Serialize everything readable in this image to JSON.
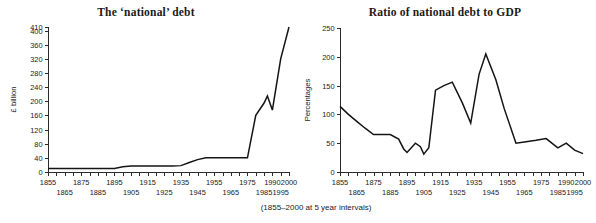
{
  "caption": "(1855–2000 at 5 year intervals)",
  "chart_data": [
    {
      "type": "line",
      "id": "national-debt",
      "title": "The ‘national’ debt",
      "xlabel": "",
      "ylabel": "£ billion",
      "ylim": [
        0,
        410
      ],
      "xlim": [
        1855,
        2000
      ],
      "grid": false,
      "legend": "none",
      "ytick_labels": [
        "0",
        "40",
        "80",
        "120",
        "160",
        "200",
        "240",
        "280",
        "320",
        "360",
        "400",
        "410"
      ],
      "ytick_values": [
        0,
        40,
        80,
        120,
        160,
        200,
        240,
        280,
        320,
        360,
        400,
        410
      ],
      "xtick_labels_top": [
        "1855",
        "1875",
        "1895",
        "1915",
        "1935",
        "1955",
        "1975",
        "1990",
        "2000"
      ],
      "xtick_labels_bottom": [
        "1865",
        "1885",
        "1905",
        "1925",
        "1945",
        "1965",
        "1985",
        "1995"
      ],
      "x": [
        1855,
        1860,
        1865,
        1870,
        1875,
        1880,
        1885,
        1890,
        1895,
        1900,
        1905,
        1910,
        1915,
        1920,
        1925,
        1930,
        1935,
        1940,
        1945,
        1950,
        1955,
        1960,
        1965,
        1970,
        1975,
        1980,
        1985,
        1990,
        1995,
        2000
      ],
      "values": [
        10,
        10,
        10,
        10,
        10,
        10,
        10,
        10,
        10,
        14,
        17,
        17,
        17,
        17,
        17,
        17,
        18,
        24,
        30,
        37,
        40,
        40,
        40,
        40,
        40,
        160,
        190,
        215,
        175,
        320,
        410
      ],
      "series": [
        {
          "name": "national debt",
          "points": [
            [
              1855,
              10
            ],
            [
              1860,
              10
            ],
            [
              1865,
              10
            ],
            [
              1870,
              10
            ],
            [
              1875,
              10
            ],
            [
              1880,
              10
            ],
            [
              1885,
              10
            ],
            [
              1890,
              10
            ],
            [
              1895,
              10
            ],
            [
              1900,
              15
            ],
            [
              1905,
              17
            ],
            [
              1910,
              17
            ],
            [
              1915,
              17
            ],
            [
              1920,
              17
            ],
            [
              1925,
              17
            ],
            [
              1930,
              17
            ],
            [
              1935,
              18
            ],
            [
              1940,
              27
            ],
            [
              1945,
              35
            ],
            [
              1950,
              40
            ],
            [
              1955,
              40
            ],
            [
              1960,
              40
            ],
            [
              1965,
              40
            ],
            [
              1970,
              40
            ],
            [
              1975,
              40
            ],
            [
              1980,
              160
            ],
            [
              1985,
              195
            ],
            [
              1987,
              215
            ],
            [
              1990,
              175
            ],
            [
              1995,
              320
            ],
            [
              2000,
              410
            ]
          ]
        }
      ]
    },
    {
      "type": "line",
      "id": "debt-to-gdp",
      "title": "Ratio of national debt to GDP",
      "xlabel": "",
      "ylabel": "Percentages",
      "ylim": [
        0,
        250
      ],
      "xlim": [
        1855,
        2000
      ],
      "grid": false,
      "legend": "none",
      "ytick_labels": [
        "0",
        "50",
        "100",
        "150",
        "200",
        "250"
      ],
      "ytick_values": [
        0,
        50,
        100,
        150,
        200,
        250
      ],
      "xtick_labels_top": [
        "1855",
        "1875",
        "1895",
        "1915",
        "1935",
        "1955",
        "1975",
        "1990",
        "2000"
      ],
      "xtick_labels_bottom": [
        "1865",
        "1885",
        "1905",
        "1925",
        "1945",
        "1965",
        "1985",
        "1995"
      ],
      "x": [
        1855,
        1860,
        1865,
        1870,
        1875,
        1880,
        1885,
        1890,
        1895,
        1900,
        1905,
        1910,
        1915,
        1920,
        1925,
        1930,
        1935,
        1940,
        1945,
        1950,
        1955,
        1960,
        1965,
        1970,
        1975,
        1980,
        1985,
        1990,
        1995,
        2000
      ],
      "values": [
        114,
        100,
        88,
        75,
        65,
        65,
        65,
        57,
        40,
        34,
        50,
        44,
        31,
        42,
        142,
        150,
        156,
        120,
        85,
        170,
        205,
        160,
        110,
        50,
        52,
        55,
        58,
        42,
        50,
        38,
        32
      ],
      "series": [
        {
          "name": "debt to GDP ratio",
          "points": [
            [
              1855,
              114
            ],
            [
              1860,
              100
            ],
            [
              1865,
              88
            ],
            [
              1870,
              76
            ],
            [
              1875,
              65
            ],
            [
              1880,
              65
            ],
            [
              1885,
              65
            ],
            [
              1890,
              57
            ],
            [
              1893,
              40
            ],
            [
              1895,
              34
            ],
            [
              1900,
              50
            ],
            [
              1903,
              44
            ],
            [
              1905,
              31
            ],
            [
              1908,
              42
            ],
            [
              1912,
              142
            ],
            [
              1917,
              150
            ],
            [
              1922,
              156
            ],
            [
              1928,
              120
            ],
            [
              1933,
              85
            ],
            [
              1938,
              170
            ],
            [
              1942,
              205
            ],
            [
              1948,
              160
            ],
            [
              1953,
              110
            ],
            [
              1960,
              50
            ],
            [
              1965,
              52
            ],
            [
              1972,
              55
            ],
            [
              1978,
              58
            ],
            [
              1985,
              42
            ],
            [
              1990,
              50
            ],
            [
              1995,
              38
            ],
            [
              2000,
              32
            ]
          ]
        }
      ]
    }
  ]
}
